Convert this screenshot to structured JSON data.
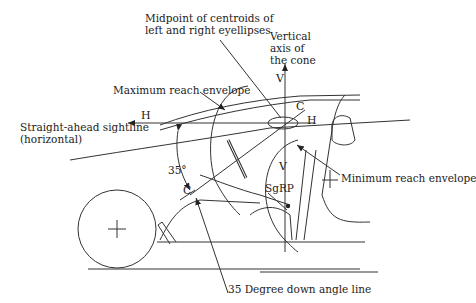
{
  "diagram": {
    "labels": {
      "midpoint_line1": "Midpoint of centroids of",
      "midpoint_line2": "left and right eyellipses",
      "vertical_axis_line1": "Vertical",
      "vertical_axis_line2": "axis of",
      "vertical_axis_line3": "the cone",
      "max_reach": "Maximum reach envelope",
      "sightline_line1": "Straight-ahead sightline",
      "sightline_line2": "(horizontal)",
      "min_reach": "Minimum reach envelope",
      "sgrp": "SgRP",
      "angle": "35°",
      "down_angle_line": "35 Degree down angle line"
    },
    "symbols": {
      "h_left": "H",
      "h_right": "H",
      "v_top": "V",
      "v_bottom": "V",
      "c_top": "C",
      "c_bottom": "C"
    },
    "colors": {
      "line": "#333333",
      "text": "#222222",
      "background": "#ffffff"
    }
  }
}
